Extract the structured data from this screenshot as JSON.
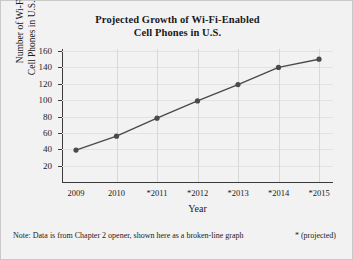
{
  "chart_data": {
    "type": "line",
    "title": "Projected Growth of Wi-Fi-Enabled Cell Phones in U.S.",
    "title_line1": "Projected Growth of Wi-Fi-Enabled",
    "title_line2": "Cell Phones in U.S.",
    "xlabel": "Year",
    "ylabel": "Number of Wi-Fi-Enabled Cell Phones in U.S. (in millions)",
    "ylabel_line1": "Number of Wi-Fi-Enabled",
    "ylabel_line2": "Cell Phones in U.S. (in millions)",
    "categories": [
      "2009",
      "2010",
      "*2011",
      "*2012",
      "*2013",
      "*2014",
      "*2015"
    ],
    "values": [
      39,
      56,
      78,
      99,
      119,
      140,
      150
    ],
    "yticks": [
      20,
      40,
      60,
      80,
      100,
      120,
      140,
      160
    ],
    "ylim": [
      0,
      160
    ],
    "grid": "both",
    "legend": "none",
    "series_color": "#4a4a4a",
    "marker_color": "#4a4a4a"
  },
  "footnote": {
    "note": "Note: Data is from Chapter 2 opener, shown here as a broken-line graph",
    "legend": "* (projected)"
  }
}
